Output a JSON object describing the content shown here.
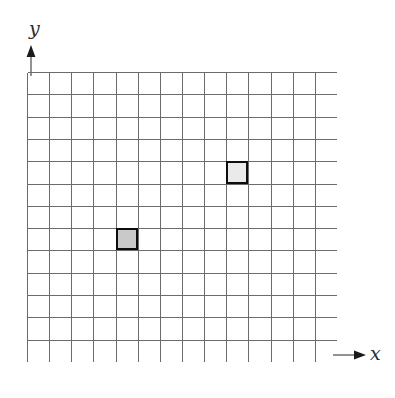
{
  "figure": {
    "type": "coordinate-grid-diagram",
    "width": 395,
    "height": 398,
    "background_color": "#ffffff"
  },
  "axes": {
    "x": {
      "label": "x",
      "icon": "arrow-right-icon",
      "arrow_direction": "right",
      "color": "#3a3a3a"
    },
    "y": {
      "label": "y",
      "icon": "arrow-up-icon",
      "arrow_direction": "up",
      "color": "#3a3a3a"
    }
  },
  "chart_data": {
    "type": "heatmap",
    "title": "",
    "xlabel": "x",
    "ylabel": "y",
    "grid": true,
    "legend": "none",
    "columns": 14,
    "rows": 13,
    "cell_width": 22.14,
    "cell_height": 22.31,
    "origin": {
      "left": 27,
      "top": 72
    },
    "plot_width": 310,
    "plot_height": 290,
    "grid_line_color": "#6b6b6b",
    "grid_line_width": 1,
    "border_color": "#6b6b6b",
    "background_color": "#ffffff",
    "xlim": [
      0,
      14
    ],
    "ylim": [
      0,
      13
    ],
    "marked_cells": [
      {
        "name": "shaded-cell-dark",
        "col": 4,
        "row_from_top": 7,
        "x": 4,
        "y": 5,
        "fill_color": "#c9c9c9",
        "border_color": "#0d0d0d",
        "border_width": 2
      },
      {
        "name": "shaded-cell-light",
        "col": 9,
        "row_from_top": 4,
        "x": 9,
        "y": 8,
        "fill_color": "#eaeaea",
        "border_color": "#0d0d0d",
        "border_width": 2
      }
    ]
  }
}
